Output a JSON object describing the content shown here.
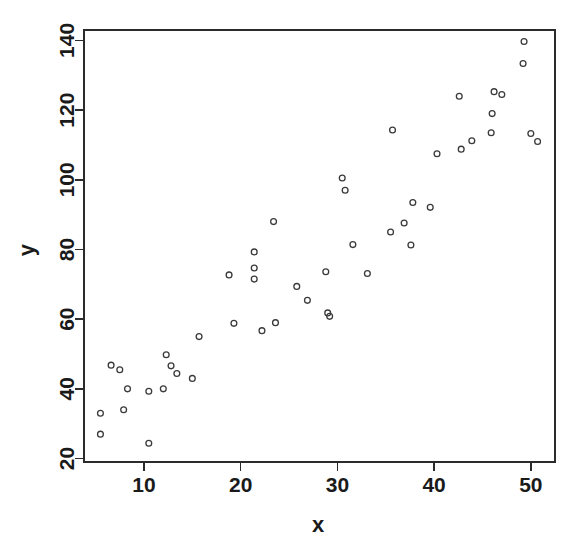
{
  "chart_data": {
    "type": "scatter",
    "title": "",
    "xlabel": "x",
    "ylabel": "y",
    "xlim": [
      3.8,
      52.5
    ],
    "ylim": [
      19.0,
      143.0
    ],
    "xticks": [
      10,
      20,
      30,
      40,
      50
    ],
    "yticks": [
      20,
      40,
      60,
      80,
      100,
      120,
      140
    ],
    "xtick_labels": [
      "10",
      "20",
      "30",
      "40",
      "50"
    ],
    "ytick_labels": [
      "20",
      "40",
      "60",
      "80",
      "100",
      "120",
      "140"
    ],
    "grid": false,
    "legend": null,
    "point_marker": "open-circle",
    "point_color": "#3a3a3a",
    "axis_color": "#2b2b2b",
    "background_color": "#ffffff",
    "n_points": 57,
    "x": [
      5.5,
      5.5,
      6.6,
      7.5,
      7.9,
      8.3,
      10.5,
      10.5,
      12.0,
      12.3,
      12.8,
      13.4,
      15.0,
      15.7,
      18.8,
      19.3,
      21.4,
      21.4,
      21.4,
      22.2,
      23.6,
      25.8,
      26.9,
      27.1,
      28.8,
      29.2,
      29.3,
      30.5,
      30.8,
      31.6,
      33.1,
      35.5,
      35.7,
      36.9,
      37.6,
      37.8,
      39.6,
      40.3,
      42.6,
      42.8,
      43.9,
      45.9,
      46.2,
      46.5,
      47.0,
      49.3,
      49.6,
      50.0,
      50.7
    ],
    "y": [
      33.0,
      27.0,
      46.8,
      45.5,
      34.0,
      40.0,
      39.3,
      24.4,
      40.0,
      49.8,
      46.6,
      44.4,
      43.0,
      55.0,
      72.7,
      58.8,
      79.3,
      74.7,
      71.5,
      56.7,
      59.0,
      69.4,
      65.4,
      61.0,
      73.6,
      62.0,
      60.8,
      100.5,
      97.0,
      81.4,
      73.1,
      85.0,
      114.3,
      87.6,
      81.3,
      93.5,
      92.1,
      107.5,
      124.0,
      108.8,
      111.2,
      113.5,
      125.3,
      119.0,
      124.5,
      139.7,
      133.4,
      113.3,
      111.0
    ],
    "points": [
      {
        "x": 5.5,
        "y": 33.0
      },
      {
        "x": 5.5,
        "y": 27.0
      },
      {
        "x": 6.6,
        "y": 46.8
      },
      {
        "x": 7.5,
        "y": 45.5
      },
      {
        "x": 7.9,
        "y": 34.0
      },
      {
        "x": 8.3,
        "y": 40.0
      },
      {
        "x": 10.5,
        "y": 39.3
      },
      {
        "x": 10.5,
        "y": 24.4
      },
      {
        "x": 12.0,
        "y": 40.0
      },
      {
        "x": 12.3,
        "y": 49.8
      },
      {
        "x": 12.8,
        "y": 46.6
      },
      {
        "x": 13.4,
        "y": 44.4
      },
      {
        "x": 15.0,
        "y": 43.0
      },
      {
        "x": 15.7,
        "y": 55.0
      },
      {
        "x": 18.8,
        "y": 72.7
      },
      {
        "x": 19.3,
        "y": 58.8
      },
      {
        "x": 21.4,
        "y": 79.3
      },
      {
        "x": 21.4,
        "y": 74.7
      },
      {
        "x": 21.4,
        "y": 71.5
      },
      {
        "x": 22.2,
        "y": 56.7
      },
      {
        "x": 23.6,
        "y": 59.0
      },
      {
        "x": 23.4,
        "y": 88.0
      },
      {
        "x": 25.8,
        "y": 69.4
      },
      {
        "x": 26.9,
        "y": 65.4
      },
      {
        "x": 28.8,
        "y": 73.6
      },
      {
        "x": 29.0,
        "y": 61.8
      },
      {
        "x": 29.2,
        "y": 60.8
      },
      {
        "x": 30.5,
        "y": 100.5
      },
      {
        "x": 30.8,
        "y": 97.0
      },
      {
        "x": 31.6,
        "y": 81.4
      },
      {
        "x": 33.1,
        "y": 73.1
      },
      {
        "x": 35.5,
        "y": 85.0
      },
      {
        "x": 35.7,
        "y": 114.3
      },
      {
        "x": 36.9,
        "y": 87.6
      },
      {
        "x": 37.6,
        "y": 81.3
      },
      {
        "x": 37.8,
        "y": 93.5
      },
      {
        "x": 39.6,
        "y": 92.1
      },
      {
        "x": 40.3,
        "y": 107.5
      },
      {
        "x": 42.6,
        "y": 124.0
      },
      {
        "x": 42.8,
        "y": 108.8
      },
      {
        "x": 43.9,
        "y": 111.2
      },
      {
        "x": 45.9,
        "y": 113.5
      },
      {
        "x": 46.2,
        "y": 125.3
      },
      {
        "x": 46.0,
        "y": 119.0
      },
      {
        "x": 47.0,
        "y": 124.5
      },
      {
        "x": 49.3,
        "y": 139.7
      },
      {
        "x": 49.2,
        "y": 133.4
      },
      {
        "x": 50.0,
        "y": 113.3
      },
      {
        "x": 50.7,
        "y": 111.0
      }
    ]
  }
}
